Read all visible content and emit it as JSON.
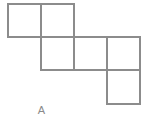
{
  "figure": {
    "caption": "A",
    "shape_name": "pentomino-net",
    "stroke_color": "#8c8c8c",
    "fill_color": "#ffffff",
    "background_color": "#ffffff",
    "stroke_width": 1.3,
    "cell_size": 33,
    "grid": {
      "columns": 4,
      "rows": 3,
      "origin_x": 8,
      "origin_y": 4,
      "column_edges": [
        8,
        41,
        74,
        107,
        140
      ],
      "row_edges": [
        4,
        37,
        70,
        104
      ]
    },
    "squares": [
      {
        "id": "square-r1c1",
        "col": 0,
        "row": 0,
        "x": 8,
        "y": 4,
        "w": 33,
        "h": 33
      },
      {
        "id": "square-r1c2",
        "col": 1,
        "row": 0,
        "x": 41,
        "y": 4,
        "w": 33,
        "h": 33
      },
      {
        "id": "square-r2c2",
        "col": 1,
        "row": 1,
        "x": 41,
        "y": 37,
        "w": 33,
        "h": 33
      },
      {
        "id": "square-r2c4",
        "col": 3,
        "row": 1,
        "x": 107,
        "y": 37,
        "w": 33,
        "h": 33
      },
      {
        "id": "square-r3c4",
        "col": 3,
        "row": 2,
        "x": 107,
        "y": 70,
        "w": 33,
        "h": 34
      }
    ],
    "connector": {
      "id": "connector-r2c3",
      "note": "horizontal edges spanning column 3 in row 2 linking the two square groups",
      "x": 74,
      "y": 37,
      "w": 33,
      "h": 33
    },
    "segments": [
      {
        "id": "seg-top-left-row1",
        "x1": 8,
        "y1": 4,
        "x2": 74,
        "y2": 4
      },
      {
        "id": "seg-left-row1",
        "x1": 8,
        "y1": 4,
        "x2": 8,
        "y2": 37
      },
      {
        "id": "seg-mid-vert-row1",
        "x1": 41,
        "y1": 4,
        "x2": 41,
        "y2": 37
      },
      {
        "id": "seg-right-vert-row1",
        "x1": 74,
        "y1": 4,
        "x2": 74,
        "y2": 37
      },
      {
        "id": "seg-bottom-row1-left",
        "x1": 8,
        "y1": 37,
        "x2": 41,
        "y2": 37
      },
      {
        "id": "seg-mid-horiz-row2",
        "x1": 41,
        "y1": 37,
        "x2": 140,
        "y2": 37
      },
      {
        "id": "seg-left-vert-row2",
        "x1": 41,
        "y1": 37,
        "x2": 41,
        "y2": 70
      },
      {
        "id": "seg-mid-vert-row2",
        "x1": 74,
        "y1": 37,
        "x2": 74,
        "y2": 70
      },
      {
        "id": "seg-right-vert-row2",
        "x1": 107,
        "y1": 37,
        "x2": 107,
        "y2": 104
      },
      {
        "id": "seg-far-right-row2",
        "x1": 140,
        "y1": 37,
        "x2": 140,
        "y2": 104
      },
      {
        "id": "seg-bottom-row2",
        "x1": 41,
        "y1": 70,
        "x2": 140,
        "y2": 70
      },
      {
        "id": "seg-bottom-row3",
        "x1": 107,
        "y1": 104,
        "x2": 140,
        "y2": 104
      }
    ]
  }
}
